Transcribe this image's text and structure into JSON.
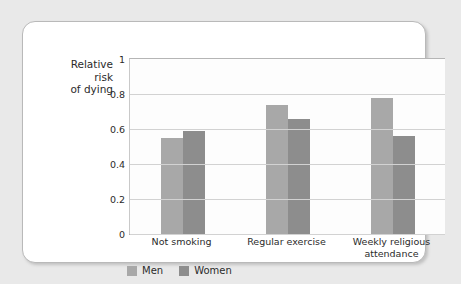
{
  "chart_data": {
    "type": "bar",
    "title": "",
    "subtitle": "",
    "xlabel": "",
    "ylabel": "Relative\nrisk\nof dying",
    "ylim": [
      0,
      1
    ],
    "yticks": [
      "0",
      "0.2",
      "0.4",
      "0.6",
      "0.8",
      "1"
    ],
    "ytick_values": [
      0,
      0.2,
      0.4,
      0.6,
      0.8,
      1
    ],
    "grid": true,
    "legend_position": "bottom-left",
    "categories": [
      "Not smoking",
      "Regular exercise",
      "Weekly religious\nattendance"
    ],
    "series": [
      {
        "name": "Men",
        "color": "#a8a8a8",
        "values": [
          0.55,
          0.74,
          0.78
        ]
      },
      {
        "name": "Women",
        "color": "#8d8d8d",
        "values": [
          0.59,
          0.66,
          0.56
        ]
      }
    ]
  },
  "colors": {
    "men": "#a8a8a8",
    "women": "#8d8d8d",
    "gridline": "#d2d2d2",
    "axis": "#b0b0b0",
    "card_background": "#ffffff",
    "card_border": "#b9b9b9",
    "page_background": "#e9e9e9",
    "text": "#2b2b2b"
  }
}
